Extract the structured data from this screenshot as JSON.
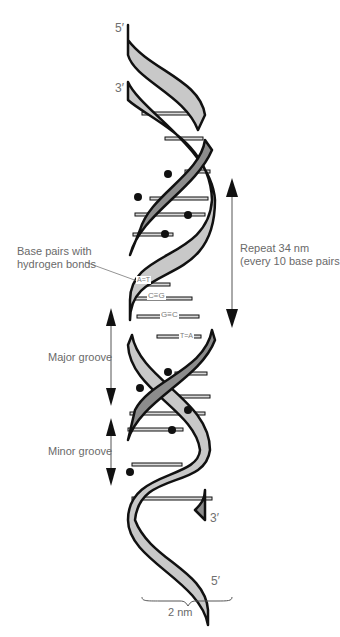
{
  "figure": {
    "ends": {
      "top_strand1": "5′",
      "top_strand2": "3′",
      "bottom_strand1": "3′",
      "bottom_strand2": "5′"
    },
    "labels": {
      "base_pairs_line1": "Base pairs with",
      "base_pairs_line2": "hydrogen bonds",
      "repeat_line1": "Repeat 34 nm",
      "repeat_line2": "(every 10 base pairs",
      "major_groove": "Major groove",
      "minor_groove": "Minor groove",
      "width": "2 nm"
    },
    "base_pairs": [
      "A=T",
      "C≡G",
      "G≡C",
      "T=A"
    ],
    "colors": {
      "outline": "#111111",
      "strand_light": "#c8c8c8",
      "strand_dark": "#8c8c8c",
      "rung": "#9a9a9a",
      "text": "#6a6a6a"
    }
  }
}
